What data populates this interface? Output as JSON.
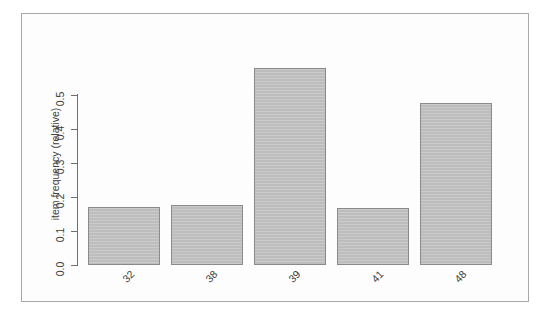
{
  "chart_data": {
    "type": "bar",
    "title": "",
    "xlabel": "",
    "ylabel": "item frequency (relative)",
    "categories": [
      "32",
      "38",
      "39",
      "41",
      "48"
    ],
    "values": [
      0.172,
      0.175,
      0.577,
      0.169,
      0.474
    ],
    "ylim": [
      0.0,
      0.6
    ],
    "yticks": [
      "0.0",
      "0.1",
      "0.2",
      "0.3",
      "0.4",
      "0.5"
    ],
    "ytick_values": [
      0.0,
      0.1,
      0.2,
      0.3,
      0.4,
      0.5
    ],
    "grid": false,
    "legend": false,
    "bar_fill_color": "#bdbdbd",
    "bar_border_color": "#8a8a8a",
    "axis_color": "#6e6e6e",
    "text_color": "#3c3c3c",
    "background_color": "#ffffff",
    "frame_color": "#a9a9a9",
    "xlabel_rotation_deg": 45
  },
  "plot": {
    "y_axis_title": "item frequency (relative)"
  }
}
